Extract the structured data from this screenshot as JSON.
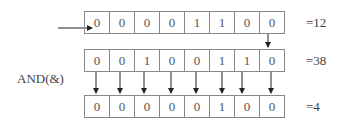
{
  "diagram": {
    "operation_label": "AND(&)",
    "rows": [
      {
        "name": "operand-a",
        "bits": [
          "0",
          "0",
          "0",
          "0",
          "1",
          "1",
          "0",
          "0"
        ],
        "result": "=12"
      },
      {
        "name": "operand-b",
        "bits": [
          "0",
          "0",
          "1",
          "0",
          "0",
          "1",
          "1",
          "0"
        ],
        "result": "=38"
      },
      {
        "name": "and-result",
        "bits": [
          "0",
          "0",
          "0",
          "0",
          "0",
          "1",
          "0",
          "0"
        ],
        "result": "=4"
      }
    ]
  }
}
